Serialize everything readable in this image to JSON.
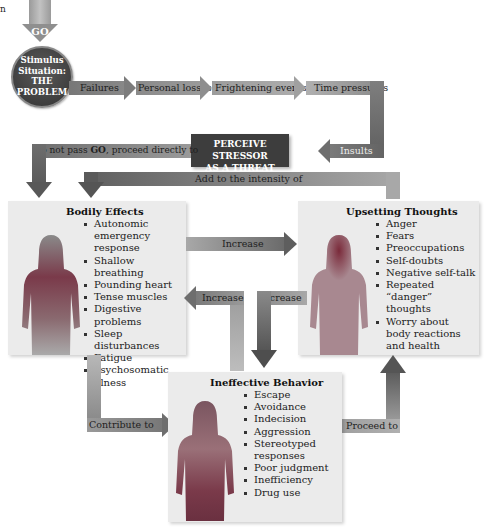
{
  "corner_mark": "n",
  "start": {
    "go_label": "GO",
    "circle_lines": [
      "Stimulus",
      "Situation:",
      "THE",
      "PROBLEM"
    ]
  },
  "stressors": {
    "items": [
      "Failures",
      "Personal losses",
      "Frightening events",
      "Time pressures",
      "Insults"
    ]
  },
  "threat": {
    "lines": [
      "PERCEIVE STRESSOR",
      "AS A THREAT"
    ],
    "bypass_prefix": "Do not pass ",
    "bypass_bold": "GO",
    "bypass_suffix": ", proceed directly to"
  },
  "connectors": {
    "add_intensity": "Add to the intensity of",
    "increase_right": "Increase",
    "increase_left": "Increase",
    "increase_down": "Increase",
    "contribute": "Contribute to",
    "proceed": "Proceed to"
  },
  "bodily_effects": {
    "title": "Bodily Effects",
    "items": [
      "Autonomic emergency response",
      "Shallow breathing",
      "Pounding heart",
      "Tense muscles",
      "Digestive problems",
      "Sleep disturbances",
      "Fatigue",
      "Psychosomatic illness"
    ]
  },
  "upsetting_thoughts": {
    "title": "Upsetting Thoughts",
    "items": [
      "Anger",
      "Fears",
      "Preoccupations",
      "Self-doubts",
      "Negative self-talk",
      "Repeated “danger” thoughts",
      "Worry about body reactions and health"
    ]
  },
  "ineffective_behavior": {
    "title": "Ineffective Behavior",
    "items": [
      "Escape",
      "Avoidance",
      "Indecision",
      "Aggression",
      "Stereotyped responses",
      "Poor judgment",
      "Inefficiency",
      "Drug use"
    ]
  },
  "colors": {
    "arrow_dark": "#555555",
    "arrow_mid": "#8a8a8a",
    "arrow_light": "#b4b4b4",
    "panel_bg": "#ebebeb",
    "threat_box": "#3a3a3a",
    "figure_body": "#a06a72",
    "figure_dark": "#7a3a4a"
  }
}
